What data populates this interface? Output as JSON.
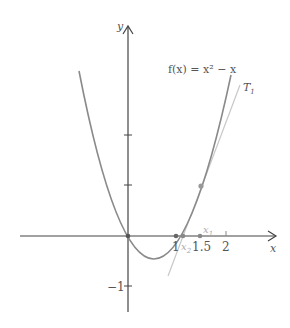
{
  "function_label": "f(x) = x² − x",
  "tangent_label": "T",
  "tangent_sub": "1",
  "axes": {
    "x_label": "x",
    "y_label": "y",
    "x_ticks": [
      "1",
      "1.5",
      "2"
    ],
    "y_ticks": [
      "−1"
    ]
  },
  "points": {
    "x1_label": "x",
    "x1_sub": "1",
    "x2_label": "x",
    "x2_sub": "2"
  },
  "colors": {
    "curve": "#8a8a8a",
    "tangent": "#c4c4c4",
    "axis": "#444444"
  }
}
